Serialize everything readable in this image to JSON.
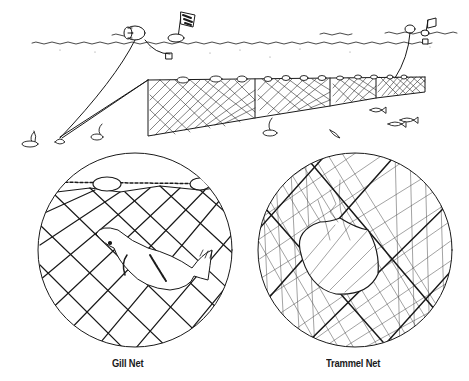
{
  "figure": {
    "type": "line-illustration",
    "colors": {
      "ink": "#1a1a1a",
      "background": "#ffffff"
    }
  },
  "scene": {
    "elements": [
      "water-surface",
      "barrel-float",
      "flag-buoy-left",
      "flag-buoy-right",
      "anchor-lines",
      "net-panels",
      "float-line",
      "anchor-weights",
      "fish-school",
      "seabed-plants"
    ]
  },
  "insets": [
    {
      "label": "Gill Net",
      "depicts": "fish caught by gills in single mesh net under float line"
    },
    {
      "label": "Trammel Net",
      "depicts": "fish pocketed in layered trammel net mesh"
    }
  ]
}
